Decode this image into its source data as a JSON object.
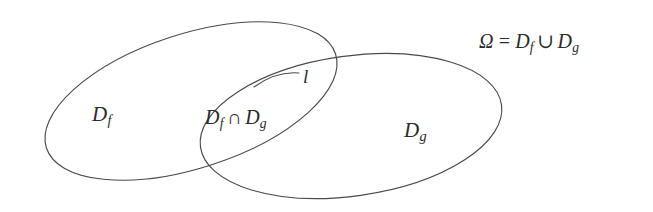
{
  "figure": {
    "type": "venn-diagram",
    "background_color": "#ffffff",
    "stroke_color": "#4a4a4a",
    "text_color": "#2b2b2b",
    "width": 653,
    "height": 212
  },
  "sets": {
    "left": {
      "name": "D_f",
      "label_D": "D",
      "label_sub": "f",
      "cx": 191,
      "cy": 101,
      "rx": 152,
      "ry": 67,
      "rotation_deg": -18
    },
    "right": {
      "name": "D_g",
      "label_D": "D",
      "label_sub": "g",
      "cx": 351,
      "cy": 126,
      "rx": 152,
      "ry": 70,
      "rotation_deg": -8
    }
  },
  "intersection": {
    "label_D1": "D",
    "label_sub1": "f",
    "operator": "∩",
    "label_D2": "D",
    "label_sub2": "g"
  },
  "curve": {
    "name": "l",
    "label": "l"
  },
  "formula": {
    "omega": "Ω",
    "equals": "=",
    "left_D": "D",
    "left_sub": "f",
    "union": "∪",
    "right_D": "D",
    "right_sub": "g"
  }
}
